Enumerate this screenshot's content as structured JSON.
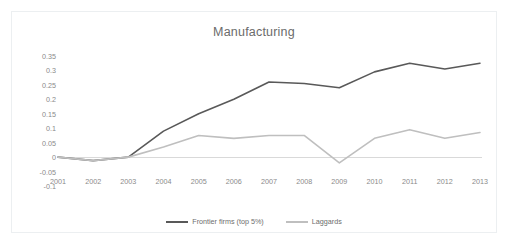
{
  "chart_data": {
    "type": "line",
    "title": "Manufacturing",
    "xlabel": "",
    "ylabel": "",
    "categories": [
      "2001",
      "2002",
      "2003",
      "2004",
      "2005",
      "2006",
      "2007",
      "2008",
      "2009",
      "2010",
      "2011",
      "2012",
      "2013"
    ],
    "x": [
      2001,
      2002,
      2003,
      2004,
      2005,
      2006,
      2007,
      2008,
      2009,
      2010,
      2011,
      2012,
      2013
    ],
    "ylim": [
      -0.1,
      0.35
    ],
    "yticks": [
      "0.35",
      "0.3",
      "0.25",
      "0.2",
      "0.15",
      "0.1",
      "0.05",
      "0",
      "-0.05",
      "-0.1"
    ],
    "ytick_values": [
      0.35,
      0.3,
      0.25,
      0.2,
      0.15,
      0.1,
      0.05,
      0,
      -0.05,
      -0.1
    ],
    "grid": false,
    "legend_position": "bottom",
    "series": [
      {
        "name": "Frontier firms (top 5%)",
        "color": "#595959",
        "values": [
          0,
          -0.012,
          0,
          0.09,
          0.15,
          0.2,
          0.26,
          0.255,
          0.24,
          0.295,
          0.325,
          0.305,
          0.325
        ]
      },
      {
        "name": "Laggards",
        "color": "#bfbfbf",
        "values": [
          0,
          -0.012,
          0,
          0.035,
          0.075,
          0.065,
          0.075,
          0.075,
          -0.02,
          0.065,
          0.095,
          0.065,
          0.085
        ]
      }
    ]
  }
}
